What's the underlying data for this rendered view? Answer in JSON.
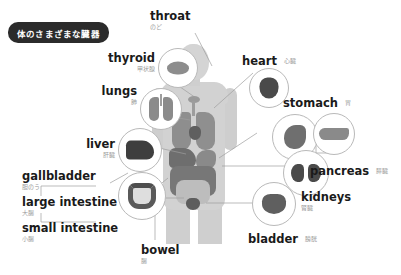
{
  "title": {
    "text": "体のさまざまな臓器"
  },
  "colors": {
    "background": "#ffffff",
    "banner": "#2b2b2b",
    "banner_text": "#ffffff",
    "label_en": "#1a1a1a",
    "label_jp": "#9b9b9b",
    "body_silhouette": "#d2d2d2",
    "callout_border": "#b9b9b9",
    "leader_line": "#9e9e9e"
  },
  "organs": [
    {
      "id": "throat",
      "en": "throat",
      "jp": "のど"
    },
    {
      "id": "thyroid",
      "en": "thyroid",
      "jp": "甲状腺"
    },
    {
      "id": "lungs",
      "en": "lungs",
      "jp": "肺"
    },
    {
      "id": "liver",
      "en": "liver",
      "jp": "肝臓"
    },
    {
      "id": "gallbladder",
      "en": "gallbladder",
      "jp": "胆のう"
    },
    {
      "id": "large-intestine",
      "en": "large intestine",
      "jp": "大腸"
    },
    {
      "id": "small-intestine",
      "en": "small intestine",
      "jp": "小腸"
    },
    {
      "id": "bowel",
      "en": "bowel",
      "jp": "腸"
    },
    {
      "id": "bladder",
      "en": "bladder",
      "jp": "膀胱"
    },
    {
      "id": "kidneys",
      "en": "kidneys",
      "jp": "腎臓"
    },
    {
      "id": "pancreas",
      "en": "pancreas",
      "jp": "膵臓"
    },
    {
      "id": "stomach",
      "en": "stomach",
      "jp": "胃"
    },
    {
      "id": "heart",
      "en": "heart",
      "jp": "心臓"
    }
  ]
}
